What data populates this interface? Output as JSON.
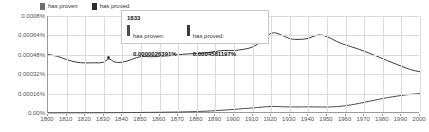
{
  "chart_data": {
    "type": "line",
    "title": "",
    "xlabel": "",
    "ylabel": "",
    "xlim": [
      1800,
      2000
    ],
    "ylim": [
      0,
      0.0008
    ],
    "grid": true,
    "legend_position": "top-left",
    "x_ticks": [
      1800,
      1810,
      1820,
      1830,
      1840,
      1850,
      1860,
      1870,
      1880,
      1890,
      1900,
      1910,
      1920,
      1930,
      1940,
      1950,
      1960,
      1970,
      1980,
      1990,
      2000
    ],
    "x_tick_labels": [
      "1800",
      "1810",
      "1820",
      "1830",
      "1840",
      "1850",
      "1860",
      "1870",
      "1880",
      "1890",
      "1900",
      "1910",
      "1920",
      "1930",
      "1940",
      "1950",
      "1960",
      "1970",
      "1980",
      "1990",
      "2000"
    ],
    "y_ticks": [
      0,
      0.00016,
      0.00032,
      0.00048,
      0.00064,
      0.0008
    ],
    "y_tick_labels": [
      "0.00%",
      "0.00016%",
      "0.00032%",
      "0.00048%",
      "0.00064%",
      "0.0008%"
    ],
    "series": [
      {
        "name": "has proven",
        "color": "#4c4c4c",
        "x": [
          1800,
          1805,
          1810,
          1815,
          1820,
          1825,
          1830,
          1833,
          1835,
          1840,
          1845,
          1850,
          1855,
          1860,
          1865,
          1870,
          1875,
          1880,
          1885,
          1890,
          1895,
          1900,
          1905,
          1910,
          1915,
          1920,
          1925,
          1930,
          1935,
          1940,
          1945,
          1950,
          1955,
          1960,
          1965,
          1970,
          1975,
          1980,
          1985,
          1990,
          1995,
          2000
        ],
        "values": [
          1e-06,
          1.2e-06,
          1.4e-06,
          1.6e-06,
          1.8e-06,
          2.1e-06,
          2.4e-06,
          2.6391e-06,
          2.8e-06,
          3.2e-06,
          3.8e-06,
          4.5e-06,
          5.2e-06,
          6e-06,
          7e-06,
          8.2e-06,
          9.8e-06,
          1.2e-05,
          1.5e-05,
          1.9e-05,
          2.4e-05,
          3e-05,
          3.6e-05,
          4.2e-05,
          4.8e-05,
          5.6e-05,
          5.2e-05,
          5e-05,
          5e-05,
          5.1e-05,
          5e-05,
          4.9e-05,
          5.2e-05,
          6e-05,
          7.2e-05,
          8.8e-05,
          0.000104,
          0.00012,
          0.000133,
          0.000145,
          0.000154,
          0.00016
        ]
      },
      {
        "name": "has proved",
        "color": "#3a3a3a",
        "x": [
          1800,
          1805,
          1810,
          1815,
          1820,
          1825,
          1830,
          1833,
          1835,
          1840,
          1845,
          1850,
          1855,
          1860,
          1865,
          1870,
          1875,
          1880,
          1885,
          1890,
          1895,
          1900,
          1905,
          1910,
          1915,
          1920,
          1925,
          1930,
          1935,
          1940,
          1945,
          1950,
          1955,
          1960,
          1965,
          1970,
          1975,
          1980,
          1985,
          1990,
          1995,
          2000
        ],
        "values": [
          0.000482,
          0.00047,
          0.00044,
          0.000418,
          0.000412,
          0.000415,
          0.000412,
          0.0004581197,
          0.000418,
          0.000415,
          0.000442,
          0.00047,
          0.000462,
          0.000468,
          0.000472,
          0.00048,
          0.000488,
          0.00049,
          0.000496,
          0.000508,
          0.000518,
          0.000514,
          0.000524,
          0.00054,
          0.00059,
          0.00067,
          0.00065,
          0.000608,
          0.000606,
          0.000612,
          0.00065,
          0.000634,
          0.00059,
          0.00056,
          0.000538,
          0.00051,
          0.00048,
          0.000448,
          0.000416,
          0.000386,
          0.000356,
          0.00034
        ]
      }
    ],
    "tooltip": {
      "year": "1833",
      "entries": [
        {
          "name": "has proven:",
          "value": "0.0000026391%",
          "color": "#4c4c4c"
        },
        {
          "name": "has proved:",
          "value": "0.0004581197%",
          "color": "#3a3a3a"
        }
      ]
    }
  },
  "legend": {
    "items": [
      {
        "label": "has proven",
        "color": "#6e6e6e"
      },
      {
        "label": "has proved",
        "color": "#2b2b2b"
      }
    ]
  }
}
